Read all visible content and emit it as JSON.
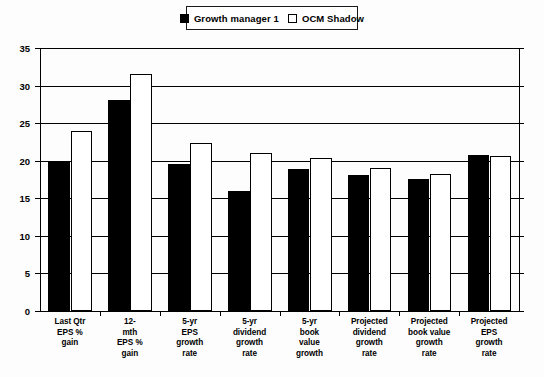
{
  "legend": {
    "position": "top-center",
    "entries": [
      {
        "label": "Growth manager 1",
        "swatch": "filled-square-icon",
        "color": "#000000"
      },
      {
        "label": "OCM Shadow",
        "swatch": "hollow-square-icon",
        "color": "#ffffff"
      }
    ]
  },
  "axes": {
    "y_ticks": [
      "0",
      "5",
      "10",
      "15",
      "20",
      "25",
      "30",
      "35"
    ]
  },
  "chart_data": {
    "type": "bar",
    "title": "",
    "xlabel": "",
    "ylabel": "",
    "ylim": [
      0,
      35
    ],
    "ytick_step": 5,
    "grid": true,
    "legend_position": "top-center",
    "categories": [
      "Last Qtr EPS % gain",
      "12-mth EPS % gain",
      "5-yr EPS growth rate",
      "5-yr dividend growth rate",
      "5-yr book value growth",
      "Projected dividend growth rate",
      "Projected book value growth rate",
      "Projected EPS growth rate"
    ],
    "category_lines": [
      [
        "Last Qtr",
        "EPS %",
        "gain"
      ],
      [
        "12-",
        "mth",
        "EPS %",
        "gain"
      ],
      [
        "5-yr",
        "EPS",
        "growth",
        "rate"
      ],
      [
        "5-yr",
        "dividend",
        "growth",
        "rate"
      ],
      [
        "5-yr",
        "book",
        "value",
        "growth"
      ],
      [
        "Projected",
        "dividend",
        "growth",
        "rate"
      ],
      [
        "Projected",
        "book value",
        "growth",
        "rate"
      ],
      [
        "Projected",
        "EPS",
        "growth",
        "rate"
      ]
    ],
    "series": [
      {
        "name": "Growth manager 1",
        "color": "#000000",
        "values": [
          20.0,
          28.1,
          19.6,
          16.0,
          18.9,
          18.1,
          17.6,
          20.7
        ]
      },
      {
        "name": "OCM Shadow",
        "color": "#ffffff",
        "values": [
          23.9,
          31.5,
          22.4,
          21.0,
          20.3,
          19.0,
          18.2,
          20.6
        ]
      }
    ]
  }
}
